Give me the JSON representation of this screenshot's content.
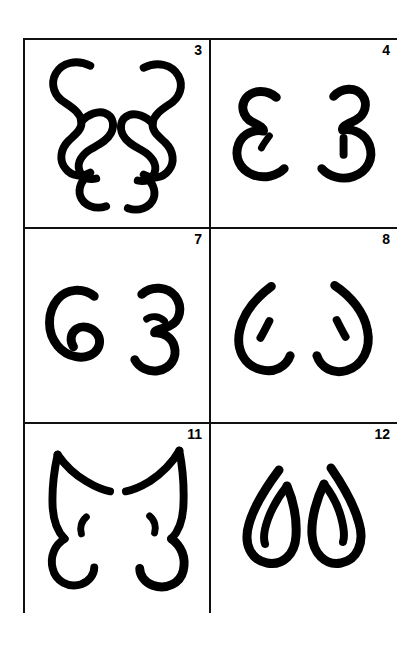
{
  "plate": {
    "background_color": "#ffffff",
    "ink_color": "#000000",
    "frame_color": "#111111",
    "layout": "2 columns x 3 rows of bordered panels",
    "description": "Scanned plate of hand-drawn mirrored symbol pairs, each panel numbered in bold at top right"
  },
  "panels": [
    {
      "number": "3",
      "position": "row1-left",
      "pair_description": "Two mirrored curvy double-lobed glyphs resembling a stylized backwards-3 with an inner hooked loop",
      "left_glyph": "epsilon-double-loop-left",
      "right_glyph": "epsilon-double-loop-right"
    },
    {
      "number": "4",
      "position": "row1-right",
      "pair_description": "An epsilon-like open glyph with a small inner tick, mirrored by a rounded 3-like glyph with a short vertical tick",
      "left_glyph": "epsilon-with-tick-left",
      "right_glyph": "three-with-tick-right"
    },
    {
      "number": "7",
      "position": "row2-left",
      "pair_description": "A G-like closed curl with an inner hook, mirrored by an open 3-like curl with a small inner arc",
      "left_glyph": "g-curl-left",
      "right_glyph": "three-curl-right"
    },
    {
      "number": "8",
      "position": "row2-right",
      "pair_description": "Two mirrored open C-shaped crescents, each enclosing a short slanted tick mark",
      "left_glyph": "crescent-with-tick-left",
      "right_glyph": "crescent-with-tick-right"
    },
    {
      "number": "11",
      "position": "row3-left",
      "pair_description": "Two mirrored angular xi-like glyphs with a pointed upper stroke and a small inner comma",
      "left_glyph": "xi-angular-left",
      "right_glyph": "xi-angular-right"
    },
    {
      "number": "12",
      "position": "row3-right",
      "pair_description": "Two mirrored teardrop or leaf outlines with an inner stroke running down the middle",
      "left_glyph": "teardrop-leaf-left",
      "right_glyph": "teardrop-leaf-right"
    }
  ]
}
